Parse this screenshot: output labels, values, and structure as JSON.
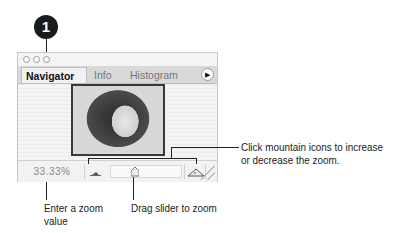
{
  "callout": {
    "number": "1"
  },
  "panel": {
    "tabs": [
      {
        "label": "Navigator",
        "active": true
      },
      {
        "label": "Info",
        "active": false
      },
      {
        "label": "Histogram",
        "active": false
      }
    ],
    "menu_icon": "triangle-right-icon",
    "thumbnail_alt": "portrait-thumbnail",
    "zoom_value": "33.33%",
    "zoom_out_icon": "small-mountain-icon",
    "zoom_in_icon": "large-mountain-icon",
    "slider_icon": "slider-thumb-icon"
  },
  "annotations": {
    "mountain_icons": "Click mountain icons to increase\nor decrease the zoom.",
    "mountain_line1": "Click mountain icons to increase",
    "mountain_line2": "or decrease the zoom.",
    "zoom_value_line1": "Enter a zoom",
    "zoom_value_line2": "value",
    "slider": "Drag slider to zoom"
  }
}
